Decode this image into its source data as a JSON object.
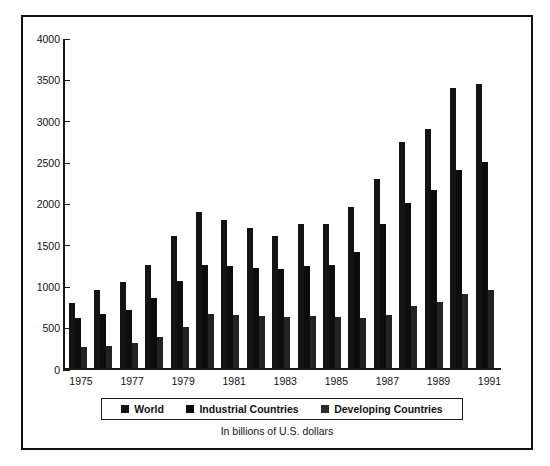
{
  "chart_data": {
    "type": "bar",
    "title": "",
    "subtitle": "",
    "caption": "In billions of U.S. dollars",
    "xlabel": "",
    "ylabel": "",
    "ylim": [
      0,
      4000
    ],
    "ytick_labels": [
      "4000",
      "3500",
      "3000",
      "2500",
      "2000",
      "1500",
      "1000",
      "500",
      "0"
    ],
    "ytick_values": [
      4000,
      3500,
      3000,
      2500,
      2000,
      1500,
      1000,
      500,
      0
    ],
    "grid": false,
    "legend_position": "bottom",
    "categories": [
      "1975",
      "1976",
      "1977",
      "1978",
      "1979",
      "1980",
      "1981",
      "1982",
      "1983",
      "1984",
      "1985",
      "1986",
      "1987",
      "1988",
      "1989",
      "1990",
      "1991"
    ],
    "xtick_labels": [
      "1975",
      "",
      "1977",
      "",
      "1979",
      "",
      "1981",
      "",
      "1983",
      "",
      "1985",
      "",
      "1987",
      "",
      "1989",
      "",
      "1991"
    ],
    "series": [
      {
        "name": "World",
        "color": "#141414",
        "values": [
          790,
          945,
          1035,
          1240,
          1590,
          1890,
          1790,
          1690,
          1590,
          1740,
          1745,
          1940,
          2285,
          2730,
          2885,
          3380,
          3435
        ]
      },
      {
        "name": "Industrial Countries",
        "color": "#0d0d0d",
        "values": [
          600,
          650,
          700,
          845,
          1050,
          1245,
          1230,
          1205,
          1195,
          1230,
          1250,
          1400,
          1745,
          1990,
          2150,
          2395,
          2495
        ]
      },
      {
        "name": "Developing Countries",
        "color": "#232323",
        "values": [
          255,
          270,
          300,
          375,
          500,
          650,
          640,
          625,
          620,
          625,
          620,
          610,
          645,
          745,
          795,
          890,
          945
        ]
      }
    ]
  },
  "legend": {
    "items": [
      {
        "label": "World"
      },
      {
        "label": "Industrial Countries"
      },
      {
        "label": "Developing Countries"
      }
    ]
  },
  "colors": {
    "frame": "#111111",
    "axis": "#1a1a1a",
    "background": "#ffffff",
    "text": "#121212"
  }
}
